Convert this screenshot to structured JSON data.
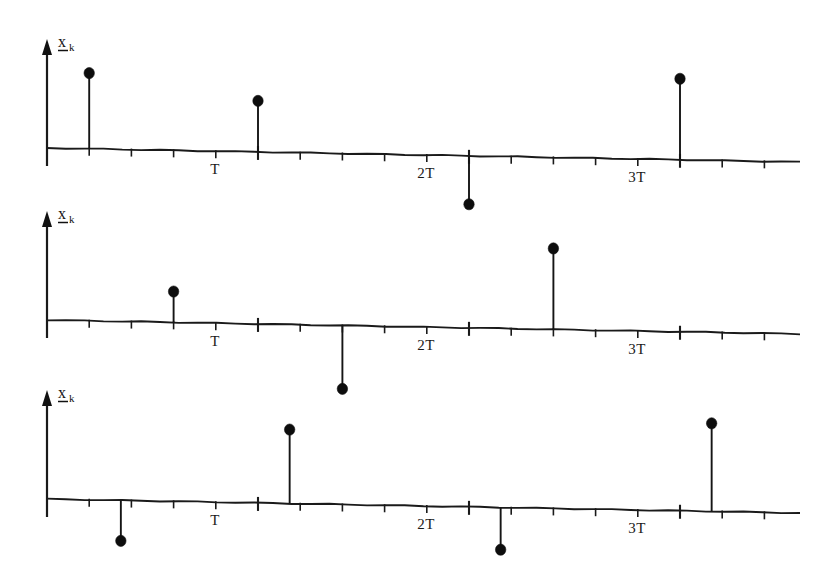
{
  "document": {
    "title": "Sampled vector signal stem plots",
    "background_color": "#ffffff",
    "ink_color": "#111111"
  },
  "chart_data": {
    "type": "scatter",
    "title": "",
    "subtitle": "",
    "xlabel": "",
    "ylabel": "x_k",
    "legend": [],
    "grid": false,
    "panel_count": 3,
    "shared": {
      "ylabel_text": "x",
      "ylabel_subscript": "k",
      "ylabel_is_vector_underlined": true,
      "x_tick_labels": [
        "T",
        "2T",
        "3T"
      ],
      "x_tick_label_values": [
        1,
        2,
        3
      ],
      "minor_ticks_per_period": 5,
      "x_axis_units": "multiples of sampling period T",
      "baseline_value": 0
    },
    "panels": [
      {
        "index": 0,
        "name": "panel-1",
        "ylabel": "x_k",
        "x_labels": [
          "T",
          "2T",
          "3T"
        ],
        "x": [
          0.2,
          1.0,
          2.0,
          3.0
        ],
        "values": [
          0.86,
          0.58,
          -0.55,
          0.92
        ],
        "points": [
          {
            "x": 0.2,
            "y": 0.86,
            "sign": "positive"
          },
          {
            "x": 1.0,
            "y": 0.58,
            "sign": "positive"
          },
          {
            "x": 2.0,
            "y": -0.55,
            "sign": "negative"
          },
          {
            "x": 3.0,
            "y": 0.92,
            "sign": "positive"
          }
        ]
      },
      {
        "index": 1,
        "name": "panel-2",
        "ylabel": "x_k",
        "x_labels": [
          "T",
          "2T",
          "3T"
        ],
        "x": [
          0.6,
          1.4,
          2.4
        ],
        "values": [
          0.35,
          -0.72,
          0.92
        ],
        "points": [
          {
            "x": 0.6,
            "y": 0.35,
            "sign": "positive"
          },
          {
            "x": 1.4,
            "y": -0.72,
            "sign": "negative"
          },
          {
            "x": 2.4,
            "y": 0.92,
            "sign": "positive"
          }
        ]
      },
      {
        "index": 2,
        "name": "panel-3",
        "ylabel": "x_k",
        "x_labels": [
          "T",
          "2T",
          "3T"
        ],
        "x": [
          0.35,
          1.15,
          2.15,
          3.15
        ],
        "values": [
          -0.46,
          0.84,
          -0.48,
          1.0
        ],
        "points": [
          {
            "x": 0.35,
            "y": -0.46,
            "sign": "negative"
          },
          {
            "x": 1.15,
            "y": 0.84,
            "sign": "positive"
          },
          {
            "x": 2.15,
            "y": -0.48,
            "sign": "negative"
          },
          {
            "x": 3.15,
            "y": 1.0,
            "sign": "positive"
          }
        ]
      }
    ],
    "geometry": {
      "origin_x": 47,
      "tick_step_px": 42.2,
      "major_tick_step_px": 211,
      "axis_right_x": 800,
      "baseline_y": [
        148,
        320,
        499
      ],
      "axis_slope_px": 14,
      "y_axis_top_offset": 105,
      "unit_px": 88
    }
  }
}
